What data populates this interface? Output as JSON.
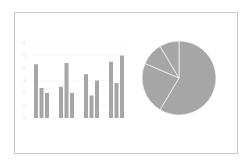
{
  "chart_data": [
    {
      "type": "bar",
      "title": "",
      "xlabel": "",
      "ylabel": "",
      "categories": [
        "Category 1",
        "Category 2",
        "Category 3",
        "Category 4"
      ],
      "show_category_labels": false,
      "series": [
        {
          "name": "Series 1",
          "values": [
            4.3,
            2.5,
            3.5,
            4.5
          ]
        },
        {
          "name": "Series 2",
          "values": [
            2.4,
            4.4,
            1.8,
            2.8
          ]
        },
        {
          "name": "Series 3",
          "values": [
            2.0,
            2.0,
            3.0,
            5.0
          ]
        }
      ],
      "ylim": [
        0,
        6
      ],
      "yticks": [
        "0",
        "1",
        "2",
        "3",
        "4",
        "5",
        "6"
      ],
      "grid": true,
      "legend": "none",
      "bar_color": "#a6a6a6"
    },
    {
      "type": "pie",
      "title": "",
      "labels": [
        "1st Qtr",
        "2nd Qtr",
        "3rd Qtr",
        "4th Qtr"
      ],
      "values": [
        8.2,
        3.2,
        1.4,
        1.2
      ],
      "start": "top",
      "direction": "clockwise",
      "legend": "none",
      "slice_color": "#a6a6a6",
      "separator_color": "#f2f2f2"
    }
  ]
}
